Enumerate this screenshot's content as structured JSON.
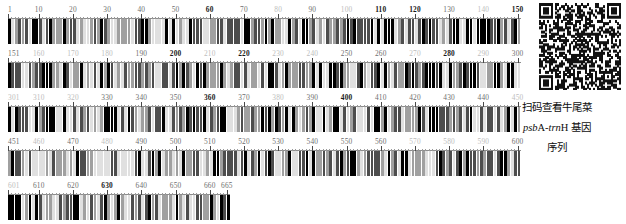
{
  "figure": {
    "type": "dna-barcode-ruler",
    "total_bases": 665,
    "bases_per_row": 150,
    "tick_interval": 10,
    "minor_tick_interval": 1,
    "colors": {
      "base_A": "#000000",
      "base_T": "#4d4d4d",
      "base_G": "#a0a0a0",
      "base_C": "#e0e0e0",
      "axis": "#8d8d8d",
      "label_dark": "#1a1a1a",
      "label_mid": "#6f6f6f",
      "label_light": "#bdbdbd",
      "background": "#ffffff"
    }
  },
  "rows": [
    {
      "start": 1,
      "end": 150,
      "labels": [
        {
          "value": "1",
          "pos": 1,
          "tone": "mid"
        },
        {
          "value": "10",
          "pos": 10,
          "tone": "mid"
        },
        {
          "value": "20",
          "pos": 20,
          "tone": "mid"
        },
        {
          "value": "30",
          "pos": 30,
          "tone": "mid"
        },
        {
          "value": "40",
          "pos": 40,
          "tone": "mid"
        },
        {
          "value": "50",
          "pos": 50,
          "tone": "mid"
        },
        {
          "value": "60",
          "pos": 60,
          "tone": "dark"
        },
        {
          "value": "70",
          "pos": 70,
          "tone": "mid"
        },
        {
          "value": "80",
          "pos": 80,
          "tone": "light"
        },
        {
          "value": "90",
          "pos": 90,
          "tone": "mid"
        },
        {
          "value": "100",
          "pos": 100,
          "tone": "light"
        },
        {
          "value": "110",
          "pos": 110,
          "tone": "dark"
        },
        {
          "value": "120",
          "pos": 120,
          "tone": "dark"
        },
        {
          "value": "130",
          "pos": 130,
          "tone": "mid"
        },
        {
          "value": "140",
          "pos": 140,
          "tone": "light"
        },
        {
          "value": "150",
          "pos": 150,
          "tone": "dark"
        }
      ]
    },
    {
      "start": 151,
      "end": 300,
      "labels": [
        {
          "value": "151",
          "pos": 151,
          "tone": "mid"
        },
        {
          "value": "160",
          "pos": 160,
          "tone": "light"
        },
        {
          "value": "170",
          "pos": 170,
          "tone": "light"
        },
        {
          "value": "180",
          "pos": 180,
          "tone": "light"
        },
        {
          "value": "190",
          "pos": 190,
          "tone": "mid"
        },
        {
          "value": "200",
          "pos": 200,
          "tone": "dark"
        },
        {
          "value": "210",
          "pos": 210,
          "tone": "light"
        },
        {
          "value": "220",
          "pos": 220,
          "tone": "dark"
        },
        {
          "value": "230",
          "pos": 230,
          "tone": "light"
        },
        {
          "value": "240",
          "pos": 240,
          "tone": "light"
        },
        {
          "value": "250",
          "pos": 250,
          "tone": "mid"
        },
        {
          "value": "260",
          "pos": 260,
          "tone": "mid"
        },
        {
          "value": "270",
          "pos": 270,
          "tone": "light"
        },
        {
          "value": "280",
          "pos": 280,
          "tone": "dark"
        },
        {
          "value": "290",
          "pos": 290,
          "tone": "light"
        },
        {
          "value": "300",
          "pos": 300,
          "tone": "mid"
        }
      ]
    },
    {
      "start": 301,
      "end": 450,
      "labels": [
        {
          "value": "301",
          "pos": 301,
          "tone": "light"
        },
        {
          "value": "310",
          "pos": 310,
          "tone": "light"
        },
        {
          "value": "320",
          "pos": 320,
          "tone": "light"
        },
        {
          "value": "330",
          "pos": 330,
          "tone": "mid"
        },
        {
          "value": "340",
          "pos": 340,
          "tone": "mid"
        },
        {
          "value": "350",
          "pos": 350,
          "tone": "mid"
        },
        {
          "value": "360",
          "pos": 360,
          "tone": "dark"
        },
        {
          "value": "370",
          "pos": 370,
          "tone": "mid"
        },
        {
          "value": "380",
          "pos": 380,
          "tone": "light"
        },
        {
          "value": "390",
          "pos": 390,
          "tone": "mid"
        },
        {
          "value": "400",
          "pos": 400,
          "tone": "dark"
        },
        {
          "value": "410",
          "pos": 410,
          "tone": "mid"
        },
        {
          "value": "420",
          "pos": 420,
          "tone": "mid"
        },
        {
          "value": "430",
          "pos": 430,
          "tone": "mid"
        },
        {
          "value": "440",
          "pos": 440,
          "tone": "mid"
        },
        {
          "value": "450",
          "pos": 450,
          "tone": "light"
        }
      ]
    },
    {
      "start": 451,
      "end": 600,
      "labels": [
        {
          "value": "451",
          "pos": 451,
          "tone": "mid"
        },
        {
          "value": "460",
          "pos": 460,
          "tone": "light"
        },
        {
          "value": "470",
          "pos": 470,
          "tone": "mid"
        },
        {
          "value": "480",
          "pos": 480,
          "tone": "light"
        },
        {
          "value": "490",
          "pos": 490,
          "tone": "mid"
        },
        {
          "value": "500",
          "pos": 500,
          "tone": "mid"
        },
        {
          "value": "510",
          "pos": 510,
          "tone": "mid"
        },
        {
          "value": "520",
          "pos": 520,
          "tone": "mid"
        },
        {
          "value": "530",
          "pos": 530,
          "tone": "mid"
        },
        {
          "value": "540",
          "pos": 540,
          "tone": "mid"
        },
        {
          "value": "550",
          "pos": 550,
          "tone": "mid"
        },
        {
          "value": "560",
          "pos": 560,
          "tone": "mid"
        },
        {
          "value": "570",
          "pos": 570,
          "tone": "light"
        },
        {
          "value": "580",
          "pos": 580,
          "tone": "light"
        },
        {
          "value": "590",
          "pos": 590,
          "tone": "light"
        },
        {
          "value": "600",
          "pos": 600,
          "tone": "mid"
        }
      ]
    },
    {
      "start": 601,
      "end": 665,
      "labels": [
        {
          "value": "601",
          "pos": 601,
          "tone": "light"
        },
        {
          "value": "610",
          "pos": 610,
          "tone": "mid"
        },
        {
          "value": "620",
          "pos": 620,
          "tone": "mid"
        },
        {
          "value": "630",
          "pos": 630,
          "tone": "dark"
        },
        {
          "value": "640",
          "pos": 640,
          "tone": "mid"
        },
        {
          "value": "650",
          "pos": 650,
          "tone": "mid"
        },
        {
          "value": "660",
          "pos": 660,
          "tone": "mid"
        },
        {
          "value": "665",
          "pos": 665,
          "tone": "mid"
        }
      ]
    }
  ],
  "qr": {
    "alt": "qr-code"
  },
  "caption": {
    "line1": "扫码查看牛尾菜",
    "line2_gene_italic": "psb",
    "line2_gene_upper": "A",
    "line2_gene_italic2": "-trn",
    "line2_gene_upper2": "H",
    "line2_tail": " 基因",
    "line3": "序列"
  }
}
